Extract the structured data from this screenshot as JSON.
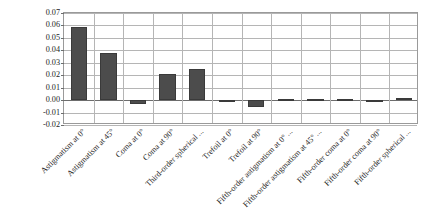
{
  "chart_data": {
    "type": "bar",
    "title": "",
    "xlabel": "",
    "ylabel": "WFE (rms waves)",
    "ylim": [
      -0.02,
      0.07
    ],
    "ytick_labels": [
      "0.07",
      "0.06",
      "0.05",
      "0.04",
      "0.03",
      "0.02",
      "0.01",
      "0.00",
      "-0.01",
      "-0.02"
    ],
    "ytick_values": [
      0.07,
      0.06,
      0.05,
      0.04,
      0.03,
      0.02,
      0.01,
      0.0,
      -0.01,
      -0.02
    ],
    "grid": true,
    "legend": "none",
    "categories": [
      "Astigmatism at 0°",
      "Astigmatism at 45°",
      "Coma at 0°",
      "Coma at 90°",
      "Third-order spherical ...",
      "Trefoil at 0°",
      "Trefoil at 90°",
      "Fifth-order astigmatism at 0° ...",
      "Fifth-order astigmatism at 45° ...",
      "Fifth-order coma at 0°",
      "Fifth-order coma at 90°",
      "Fifth-order spherical ..."
    ],
    "values": [
      0.0585,
      0.0378,
      -0.0028,
      0.0212,
      0.0248,
      -0.0012,
      -0.0052,
      0.0003,
      0.0003,
      0.0,
      -0.0015,
      0.0018
    ],
    "bar_color": "#4c4c4c",
    "grid_color": "#b5b5b5",
    "axis_color": "#6d6d6d"
  }
}
